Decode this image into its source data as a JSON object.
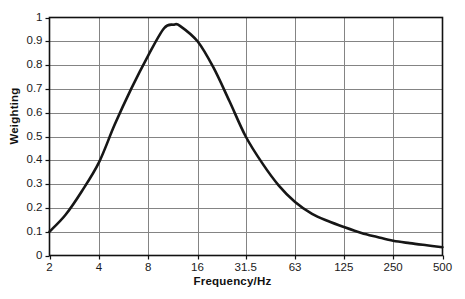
{
  "chart_data": {
    "type": "line",
    "title": "",
    "xlabel": "Frequency/Hz",
    "ylabel": "Weighting",
    "xscale": "log",
    "xlim": [
      2,
      500
    ],
    "ylim": [
      0,
      1
    ],
    "grid": true,
    "legend": false,
    "xticks": [
      2,
      4,
      8,
      16,
      31.5,
      63,
      125,
      250,
      500
    ],
    "xtick_labels": [
      "2",
      "4",
      "8",
      "16",
      "31.5",
      "63",
      "125",
      "250",
      "500"
    ],
    "yticks": [
      0,
      0.1,
      0.2,
      0.3,
      0.4,
      0.5,
      0.6,
      0.7,
      0.8,
      0.9,
      1
    ],
    "ytick_labels": [
      "0",
      "0.1",
      "0.2",
      "0.3",
      "0.4",
      "0.5",
      "0.6",
      "0.7",
      "0.8",
      "0.9",
      "1"
    ],
    "line_color": "#161616",
    "line_width": 2.6,
    "grid_color": "#848484",
    "axis_color": "#111111",
    "background": "#ffffff",
    "series": [
      {
        "name": "Weighting",
        "x": [
          2,
          2.5,
          3.15,
          4,
          5,
          6.3,
          8,
          10,
          11.5,
          12.5,
          16,
          20,
          25,
          31.5,
          40,
          50,
          63,
          80,
          100,
          125,
          160,
          200,
          250,
          315,
          400,
          500
        ],
        "values": [
          0.1,
          0.17,
          0.27,
          0.39,
          0.55,
          0.7,
          0.84,
          0.955,
          0.97,
          0.965,
          0.9,
          0.79,
          0.65,
          0.5,
          0.385,
          0.295,
          0.225,
          0.175,
          0.145,
          0.12,
          0.095,
          0.078,
          0.062,
          0.052,
          0.043,
          0.035
        ]
      }
    ]
  },
  "axis_titles": {
    "x": "Frequency/Hz",
    "y": "Weighting"
  }
}
